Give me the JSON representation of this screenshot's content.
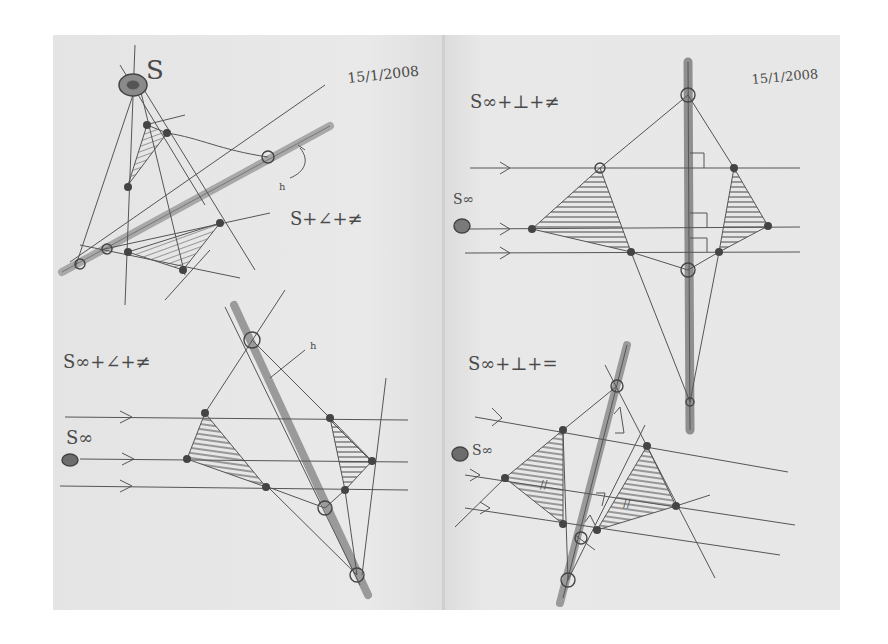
{
  "sketches": {
    "top_left": {
      "source_label": "S",
      "date": "15/1/2008",
      "condition": "S+∠+≠",
      "line_label": "h"
    },
    "top_right": {
      "source_label": "S∞",
      "date": "15/1/2008",
      "condition": "S∞+⊥+≠"
    },
    "bottom_left": {
      "source_label": "S∞",
      "condition": "S∞+∠+≠",
      "line_label": "h"
    },
    "bottom_right": {
      "source_label": "S∞",
      "condition": "S∞+⊥+="
    }
  },
  "colors": {
    "paper": "#e8e8e8",
    "ink": "#4a4a4a",
    "marker": "#9a9a9a"
  }
}
